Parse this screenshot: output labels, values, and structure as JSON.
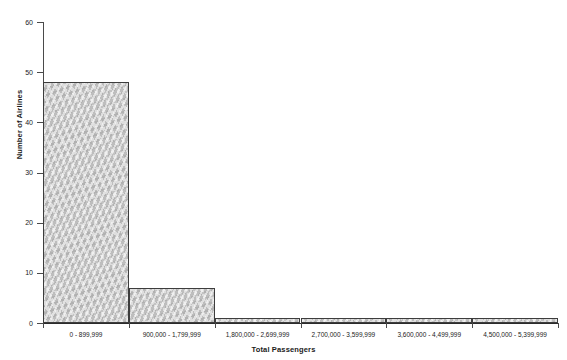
{
  "chart_data": {
    "type": "bar",
    "title": "",
    "subtitle": "",
    "xlabel": "Total Passengers",
    "ylabel": "Number of Airlines",
    "categories": [
      "0 - 899,999",
      "900,000 - 1,799,999",
      "1,800,000 - 2,699,999",
      "2,700,000 - 3,599,999",
      "3,600,000 - 4,499,999",
      "4,500,000 - 5,399,999"
    ],
    "values": [
      48,
      7,
      1,
      1,
      1,
      1
    ],
    "ylim": [
      0,
      60
    ],
    "yticks": [
      0,
      10,
      20,
      30,
      40,
      50,
      60
    ],
    "ytick_labels": [
      "0",
      "10",
      "20",
      "30",
      "40",
      "50",
      "60"
    ],
    "grid": false,
    "legend": null,
    "bar_fill_color": "#c9c9c9",
    "bar_edge_color": "#3d3d3d",
    "axis_color": "#4a4a4a",
    "background_color": "#ffffff"
  }
}
